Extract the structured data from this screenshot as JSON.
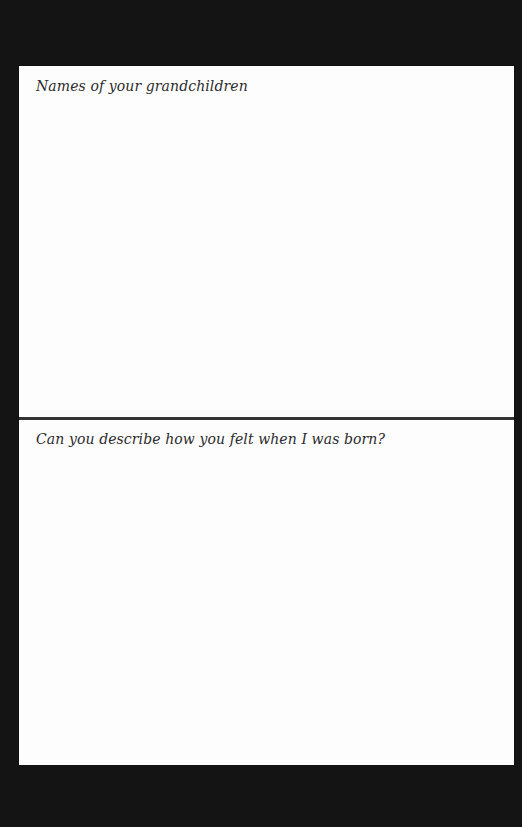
{
  "page": {
    "sections": [
      {
        "prompt": "Names of your grandchildren",
        "answer": ""
      },
      {
        "prompt": "Can you describe how you felt when I was born?",
        "answer": ""
      }
    ]
  },
  "colors": {
    "background": "#141414",
    "paper": "#fdfdfd",
    "divider": "#333333",
    "text": "#2b2b2b"
  }
}
